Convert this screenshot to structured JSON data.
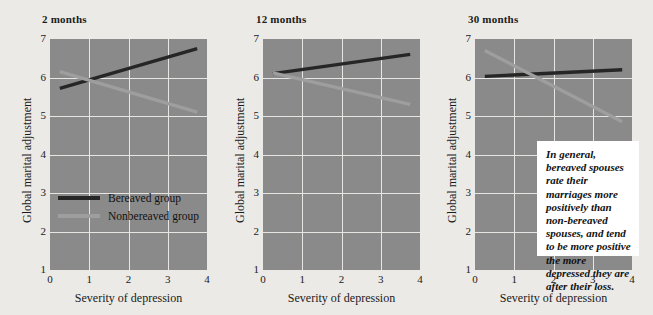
{
  "figure": {
    "background_color": "#eceae6",
    "plot_background_color": "#8a8a8a",
    "grid_color": "#e8e6e2"
  },
  "legend": {
    "position": "inside-panel-1-lower-left",
    "entries": [
      {
        "label": "Bereaved group",
        "color": "#262626"
      },
      {
        "label": "Nonbereaved group",
        "color": "#9e9e9e"
      }
    ]
  },
  "callout": {
    "text": "In general, bereaved spouses rate their marriages more positively than non-bereaved spouses, and tend to be more positive the more depressed they are after their loss."
  },
  "chart_data": [
    {
      "type": "line",
      "title": "2 months",
      "xlabel": "Severity of depression",
      "ylabel": "Global marital adjustment",
      "xlim": [
        0,
        4
      ],
      "ylim": [
        1,
        7
      ],
      "xticks": [
        "0",
        "1",
        "2",
        "3",
        "4"
      ],
      "yticks": [
        "1",
        "2",
        "3",
        "4",
        "5",
        "6",
        "7"
      ],
      "grid": true,
      "series": [
        {
          "name": "Bereaved group",
          "color": "#262626",
          "x": [
            0.25,
            3.75
          ],
          "y": [
            5.72,
            6.75
          ]
        },
        {
          "name": "Nonbereaved group",
          "color": "#9e9e9e",
          "x": [
            0.25,
            3.75
          ],
          "y": [
            6.15,
            5.1
          ]
        }
      ]
    },
    {
      "type": "line",
      "title": "12 months",
      "xlabel": "Severity of depression",
      "ylabel": "Global marital adjustment",
      "xlim": [
        0,
        4
      ],
      "ylim": [
        1,
        7
      ],
      "xticks": [
        "0",
        "1",
        "2",
        "3",
        "4"
      ],
      "yticks": [
        "1",
        "2",
        "3",
        "4",
        "5",
        "6",
        "7"
      ],
      "grid": true,
      "series": [
        {
          "name": "Bereaved group",
          "color": "#262626",
          "x": [
            0.25,
            3.75
          ],
          "y": [
            6.1,
            6.6
          ]
        },
        {
          "name": "Nonbereaved group",
          "color": "#9e9e9e",
          "x": [
            0.25,
            3.75
          ],
          "y": [
            6.12,
            5.3
          ]
        }
      ]
    },
    {
      "type": "line",
      "title": "30 months",
      "xlabel": "Severity of depression",
      "ylabel": "Global marital adjustment",
      "xlim": [
        0,
        4
      ],
      "ylim": [
        1,
        7
      ],
      "xticks": [
        "0",
        "1",
        "2",
        "3",
        "4"
      ],
      "yticks": [
        "1",
        "2",
        "3",
        "4",
        "5",
        "6",
        "7"
      ],
      "grid": true,
      "series": [
        {
          "name": "Bereaved group",
          "color": "#262626",
          "x": [
            0.25,
            3.75
          ],
          "y": [
            6.03,
            6.2
          ]
        },
        {
          "name": "Nonbereaved group",
          "color": "#9e9e9e",
          "x": [
            0.25,
            3.75
          ],
          "y": [
            6.7,
            4.85
          ]
        }
      ]
    }
  ]
}
